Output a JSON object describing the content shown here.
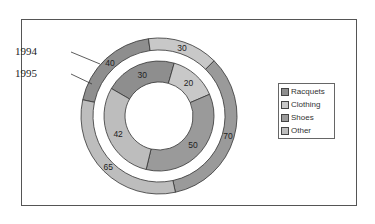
{
  "chart_data": {
    "type": "doughnut",
    "title": "",
    "categories": [
      "Racquets",
      "Clothing",
      "Shoes",
      "Other"
    ],
    "series": [
      {
        "name": "1994",
        "ring": "outer",
        "values": [
          40,
          30,
          70,
          65
        ]
      },
      {
        "name": "1995",
        "ring": "inner",
        "values": [
          30,
          20,
          50,
          42
        ]
      }
    ],
    "colors": {
      "Racquets": "#8e8e8e",
      "Clothing": "#c8c8c8",
      "Shoes": "#9a9a9a",
      "Other": "#bdbdbd"
    },
    "legend_position": "right",
    "series_labels": [
      "1994",
      "1995"
    ]
  },
  "legend": {
    "items": [
      {
        "label": "Racquets",
        "color": "#8e8e8e"
      },
      {
        "label": "Clothing",
        "color": "#c8c8c8"
      },
      {
        "label": "Shoes",
        "color": "#9a9a9a"
      },
      {
        "label": "Other",
        "color": "#bdbdbd"
      }
    ]
  },
  "annotations": {
    "outer_label": "1994",
    "inner_label": "1995"
  }
}
